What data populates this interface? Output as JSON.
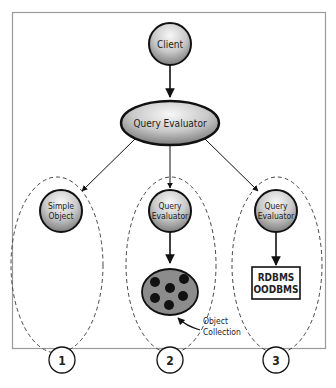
{
  "diagram": {
    "nodes": {
      "client": "Client",
      "query_evaluator_main": "Query Evaluator",
      "simple_object_line1": "Simple",
      "simple_object_line2": "Object",
      "query_evaluator_2_line1": "Query",
      "query_evaluator_2_line2": "Evaluator",
      "query_evaluator_3_line1": "Query",
      "query_evaluator_3_line2": "Evaluator",
      "db_box_line1": "RDBMS",
      "db_box_line2": "OODBMS"
    },
    "annotation": {
      "line1": "Object",
      "line2": "Collection"
    },
    "groups": [
      {
        "number": "1"
      },
      {
        "number": "2"
      },
      {
        "number": "3"
      }
    ],
    "colors": {
      "node_fill_light": "#f2f2f2",
      "node_fill_dark": "#8a8a8a",
      "collection_fill": "#8c8c8c",
      "dot": "#111111",
      "frame": "#9a9a9a",
      "stroke": "#111111"
    }
  }
}
